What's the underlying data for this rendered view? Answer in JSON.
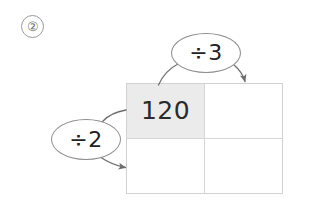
{
  "problem": {
    "number_label": "②"
  },
  "grid": {
    "rows": [
      [
        {
          "value": "120",
          "shaded": true
        },
        {
          "value": "",
          "shaded": false
        }
      ],
      [
        {
          "value": "",
          "shaded": false
        },
        {
          "value": "",
          "shaded": false
        }
      ]
    ]
  },
  "operators": [
    {
      "id": "divide-by-3",
      "label": "÷3",
      "from": "top-left-cell",
      "to": "top-right-cell"
    },
    {
      "id": "divide-by-2",
      "label": "÷2",
      "from": "top-left-cell",
      "to": "bottom-left-cell"
    }
  ],
  "colors": {
    "shaded_cell": "#ebebeb",
    "grid_line": "#d6d6d6",
    "bubble_outline": "#8d8d8d",
    "arrow": "#6e6e6e",
    "text": "#2b2b2b",
    "background": "#ffffff"
  }
}
